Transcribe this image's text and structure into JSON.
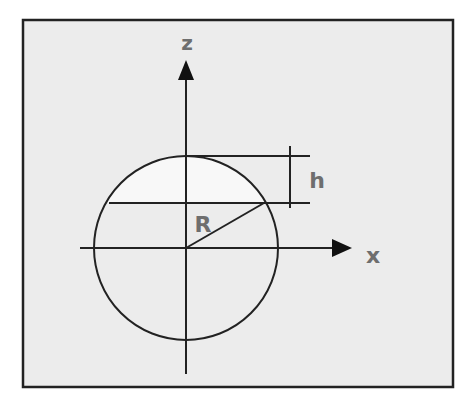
{
  "diagram": {
    "colors": {
      "background": "#ffffff",
      "panel_fill": "#ececec",
      "cap_fill": "#f8f8f8",
      "stroke": "#222222",
      "label": "#6e6e6e"
    },
    "frame": {
      "x": 23,
      "y": 20,
      "width": 430,
      "height": 367
    },
    "axes": {
      "z": {
        "label": "z",
        "x": 186,
        "y_top": 78,
        "y_bottom": 374,
        "arrow_tip_y": 60
      },
      "x": {
        "label": "x",
        "y": 248,
        "x_left": 80,
        "x_right": 335,
        "arrow_tip_x": 352
      }
    },
    "circle": {
      "cx": 186,
      "cy": 248,
      "r": 92
    },
    "chord": {
      "y": 203,
      "x_left": 109,
      "x_right": 310
    },
    "top_tangent": {
      "y": 156,
      "x_left": 186,
      "x_right": 310
    },
    "height_marker": {
      "x": 290,
      "y_top": 146,
      "y_bottom": 208,
      "label": "h"
    },
    "radius": {
      "x1": 186,
      "y1": 248,
      "x2": 264,
      "y2": 203,
      "label": "R"
    },
    "labels": {
      "z": {
        "text": "z",
        "x": 187,
        "y": 43
      },
      "x": {
        "text": "x",
        "x": 373,
        "y": 257
      },
      "h": {
        "text": "h",
        "x": 317,
        "y": 182
      },
      "R": {
        "text": "R",
        "x": 203,
        "y": 225
      }
    }
  }
}
